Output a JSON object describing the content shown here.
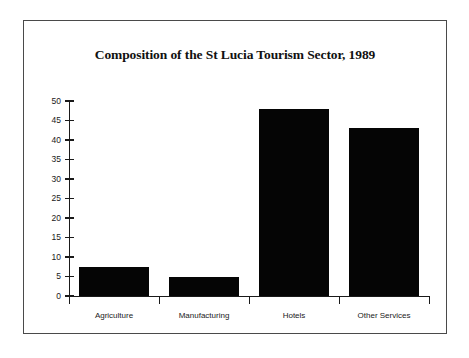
{
  "chart_data": {
    "type": "bar",
    "title": "Composition of the St Lucia Tourism Sector, 1989",
    "xlabel": "",
    "ylabel": "",
    "categories": [
      "Agriculture",
      "Manufacturing",
      "Hotels",
      "Other Services"
    ],
    "values": [
      7.5,
      4.8,
      48,
      43
    ],
    "ylim": [
      0,
      50
    ],
    "yticks": [
      0,
      5,
      10,
      15,
      20,
      25,
      30,
      35,
      40,
      45,
      50
    ],
    "ytick_labels": [
      "0",
      "5",
      "10",
      "15",
      "20",
      "25",
      "30",
      "35",
      "40",
      "45",
      "50"
    ],
    "grid": false,
    "legend": null,
    "bar_color": "#050505",
    "axis_color": "#1a1a1a",
    "background_color": "#ffffff",
    "frame_color": "#4a4a4a"
  }
}
